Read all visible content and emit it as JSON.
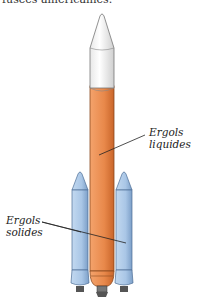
{
  "header": {
    "cropped_text": "fusées américaines."
  },
  "labels": {
    "liquid": {
      "line1": "Ergols",
      "line2": "liquides"
    },
    "solid": {
      "line1": "Ergols",
      "line2": "solides"
    }
  },
  "colors": {
    "tank": "#e8884a",
    "tank_dark": "#c9652a",
    "booster": "#a9c6e6",
    "booster_dark": "#6f93bd",
    "fairing": "#ffffff"
  }
}
